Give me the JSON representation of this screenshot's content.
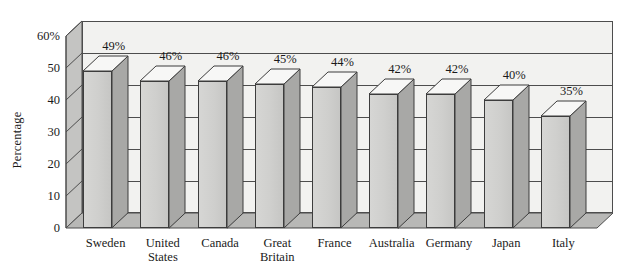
{
  "chart_data": {
    "type": "bar",
    "title": "",
    "subtitle": "",
    "xlabel": "",
    "ylabel": "Percentage",
    "ylim": [
      0,
      60
    ],
    "ytick_labels": [
      "0",
      "10",
      "20",
      "30",
      "40",
      "50",
      "60%"
    ],
    "ytick_values": [
      0,
      10,
      20,
      30,
      40,
      50,
      60
    ],
    "grid": true,
    "legend": null,
    "style": "3d-column",
    "categories": [
      "Sweden",
      "United\nStates",
      "Canada",
      "Great\nBritain",
      "France",
      "Australia",
      "Germany",
      "Japan",
      "Italy"
    ],
    "values": [
      49,
      46,
      46,
      45,
      44,
      42,
      42,
      40,
      35
    ],
    "data_labels": [
      "49%",
      "46%",
      "46%",
      "45%",
      "44%",
      "42%",
      "42%",
      "40%",
      "35%"
    ],
    "colors": {
      "bar_front": "#cfcfcd",
      "bar_side": "#a8a8a6",
      "bar_top": "#f7f7f6",
      "panel_back": "#f2f2f0",
      "panel_left": "#c4c4c2",
      "panel_floor": "#b8b8b6",
      "outline": "#3d3d3d",
      "text": "#1a1a1a",
      "background": "#ffffff"
    }
  }
}
